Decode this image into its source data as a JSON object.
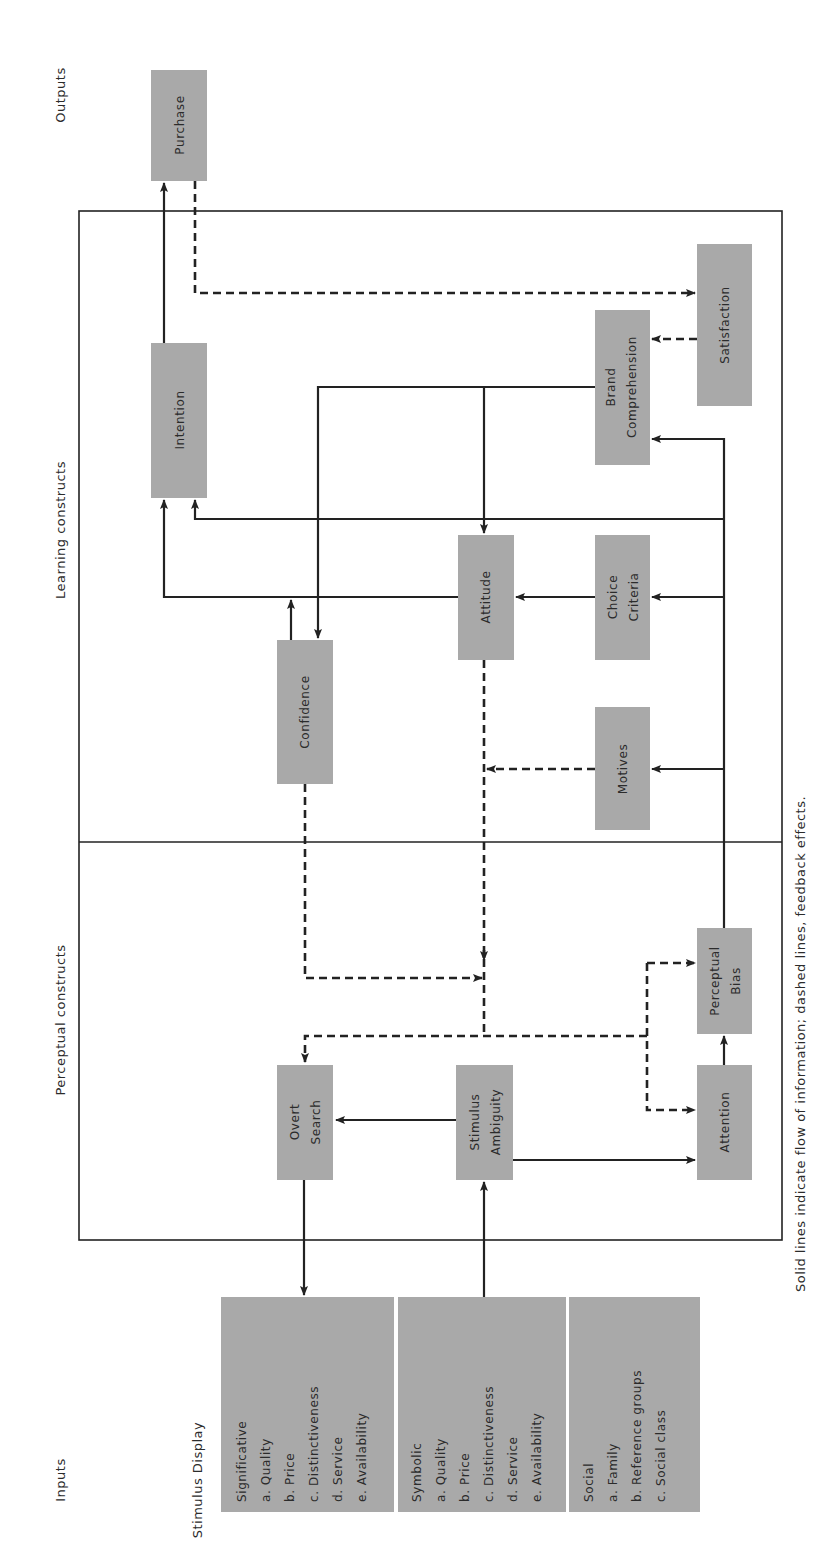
{
  "section_labels": {
    "outputs": "Outputs",
    "learning": "Learning constructs",
    "perceptual": "Perceptual constructs",
    "inputs": "Inputs",
    "stimulus_display": "Stimulus Display"
  },
  "nodes": {
    "purchase": [
      "Purchase"
    ],
    "intention": [
      "Intention"
    ],
    "brand_comprehension": [
      "Brand",
      "Comprehension"
    ],
    "satisfaction": [
      "Satisfaction"
    ],
    "attitude": [
      "Attitude"
    ],
    "choice_criteria": [
      "Choice",
      "Criteria"
    ],
    "confidence": [
      "Confidence"
    ],
    "motives": [
      "Motives"
    ],
    "perceptual_bias": [
      "Perceptual",
      "Bias"
    ],
    "overt_search": [
      "Overt",
      "Search"
    ],
    "stimulus_ambiguity": [
      "Stimulus",
      "Ambiguity"
    ],
    "attention": [
      "Attention"
    ]
  },
  "inputs": [
    {
      "title": "Significative",
      "items": [
        "a.  Quality",
        "b.  Price",
        "c.  Distinctiveness",
        "d.  Service",
        "e.  Availability"
      ]
    },
    {
      "title": "Symbolic",
      "items": [
        "a.  Quality",
        "b.  Price",
        "c.  Distinctiveness",
        "d.  Service",
        "e.  Availability"
      ]
    },
    {
      "title": "Social",
      "items": [
        "a.  Family",
        "b.  Reference groups",
        "c.  Social class"
      ]
    }
  ],
  "caption": "Solid lines indicate flow of information; dashed lines, feedback effects.",
  "colors": {
    "box_fill": "#a9a9a9",
    "line": "#222222",
    "background": "#ffffff"
  }
}
